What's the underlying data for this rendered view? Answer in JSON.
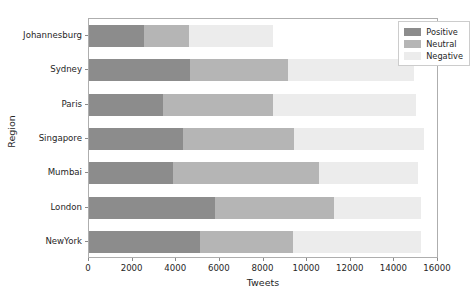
{
  "chart_data": {
    "type": "bar",
    "orientation": "horizontal",
    "stacked": true,
    "title": "",
    "xlabel": "Tweets",
    "ylabel": "Region",
    "categories": [
      "Johannesburg",
      "Sydney",
      "Paris",
      "Singapore",
      "Mumbai",
      "London",
      "NewYork"
    ],
    "series": [
      {
        "name": "Positive",
        "color": "#8c8c8c",
        "values": [
          2520,
          4630,
          3390,
          4310,
          3850,
          5780,
          5090
        ]
      },
      {
        "name": "Neutral",
        "color": "#b5b5b5",
        "values": [
          2060,
          4490,
          5040,
          5090,
          6690,
          5450,
          4260
        ]
      },
      {
        "name": "Negative",
        "color": "#ececec",
        "values": [
          3850,
          5780,
          6570,
          5950,
          4560,
          3970,
          5850
        ]
      }
    ],
    "totals": [
      8430,
      14900,
      15000,
      15350,
      15100,
      15200,
      15200
    ],
    "xlim": [
      0,
      16000
    ],
    "xticks": [
      0,
      2000,
      4000,
      6000,
      8000,
      10000,
      12000,
      14000,
      16000
    ],
    "xtick_labels": [
      "0",
      "2000",
      "4000",
      "6000",
      "8000",
      "10000",
      "12000",
      "14000",
      "16000"
    ],
    "grid": false,
    "legend_position": "upper right",
    "legend_entries": [
      "Positive",
      "Neutral",
      "Negative"
    ]
  },
  "axes": {
    "ylabel": "Region",
    "xlabel": "Tweets"
  },
  "legend": {
    "items": [
      {
        "label": "Positive"
      },
      {
        "label": "Neutral"
      },
      {
        "label": "Negative"
      }
    ]
  }
}
